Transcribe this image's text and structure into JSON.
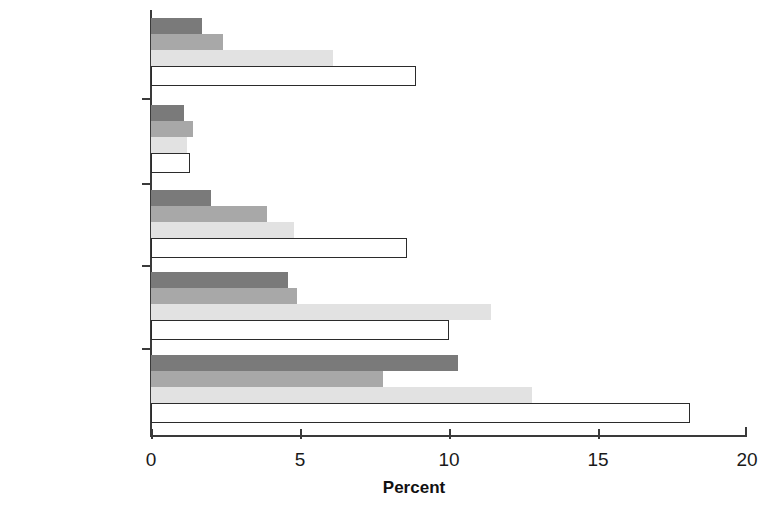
{
  "chart_data": {
    "type": "bar",
    "orientation": "horizontal",
    "title": "",
    "xlabel": "Percent",
    "ylabel": "",
    "xlim": [
      0,
      20
    ],
    "xticks": [
      0,
      5,
      10,
      15,
      20
    ],
    "xtick_labels": [
      "0",
      "5",
      "10",
      "15",
      "20"
    ],
    "grid": false,
    "legend": "none",
    "categories": [
      "All",
      "Self-employed,\nfarm",
      "Self-employed,\noff-farm",
      "Private wage",
      "Public wage"
    ],
    "series": [
      {
        "name": "series-1",
        "color": "#7a7a7a",
        "values": [
          1.7,
          1.1,
          2.0,
          4.6,
          10.3
        ]
      },
      {
        "name": "series-2",
        "color": "#a8a8a8",
        "values": [
          2.4,
          1.4,
          3.9,
          4.9,
          7.8
        ]
      },
      {
        "name": "series-3",
        "color": "#e2e2e2",
        "values": [
          6.1,
          1.2,
          4.8,
          11.4,
          12.8
        ]
      },
      {
        "name": "series-4",
        "color": "#ffffff",
        "values": [
          8.9,
          1.3,
          8.6,
          10.0,
          18.1
        ]
      }
    ]
  },
  "axis": {
    "x_title": "Percent",
    "tick_labels": [
      "0",
      "5",
      "10",
      "15",
      "20"
    ]
  },
  "categories": [
    {
      "id": "all",
      "label": "All"
    },
    {
      "id": "self-employed-farm",
      "label": "Self-employed,\nfarm"
    },
    {
      "id": "self-employed-off-farm",
      "label": "Self-employed,\noff-farm"
    },
    {
      "id": "private-wage",
      "label": "Private wage"
    },
    {
      "id": "public-wage",
      "label": "Public wage"
    }
  ],
  "colors": {
    "series_1": "#7a7a7a",
    "series_2": "#a8a8a8",
    "series_3": "#e2e2e2",
    "series_4_fill": "#ffffff",
    "series_4_stroke": "#2b2b2b",
    "axis": "#3a3a3a",
    "text": "#1a1a1a"
  }
}
